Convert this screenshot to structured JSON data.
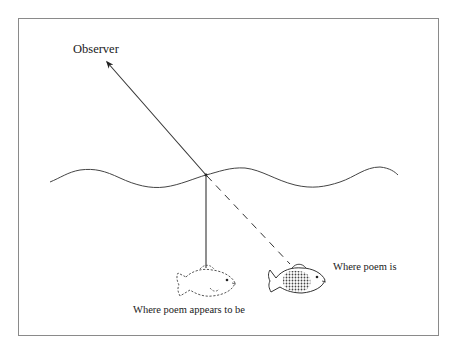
{
  "diagram": {
    "type": "refraction-illustration",
    "frame": {
      "x": 18,
      "y": 18,
      "width": 420,
      "height": 317,
      "stroke": "#8a8a8a"
    },
    "colors": {
      "ink": "#333333",
      "frame": "#8a8a8a"
    },
    "labels": {
      "observer": "Observer",
      "actual_position": "Where poem is",
      "apparent_position": "Where poem appears to be"
    },
    "water_surface": {
      "x_start": 50,
      "x_end": 398,
      "y_mid": 178
    },
    "refraction_point": {
      "x": 206,
      "y": 175
    },
    "rays": {
      "to_observer": {
        "from": [
          206,
          175
        ],
        "to": [
          106,
          61
        ],
        "style": "solid-arrow"
      },
      "apparent_vertical": {
        "from": [
          206,
          175
        ],
        "to": [
          206,
          268
        ],
        "style": "solid"
      },
      "actual_dashed": {
        "from": [
          206,
          175
        ],
        "to": [
          290,
          264
        ],
        "style": "dashed"
      }
    },
    "fish": {
      "apparent": {
        "cx": 207,
        "cy": 283,
        "style": "dashed-outline"
      },
      "actual": {
        "cx": 298,
        "cy": 278,
        "style": "solid-hatched"
      }
    }
  }
}
